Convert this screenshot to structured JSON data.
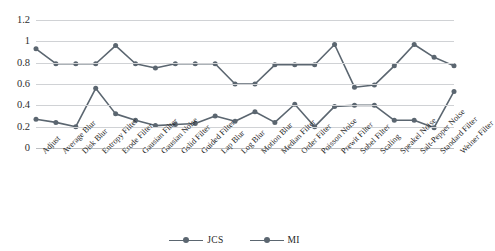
{
  "top_sliver_text": "",
  "chart_data": {
    "type": "line",
    "title": "",
    "subtitle": "",
    "xlabel": "",
    "ylabel": "",
    "ylim": [
      0,
      1.2
    ],
    "yticks": [
      "0",
      "0.2",
      "0.4",
      "0.6",
      "0.8",
      "1",
      "1.2"
    ],
    "ytick_values": [
      0,
      0.2,
      0.4,
      0.6,
      0.8,
      1,
      1.2
    ],
    "grid": "horizontal",
    "legend_position": "bottom",
    "categories": [
      "Adjust",
      "Average Blur",
      "Disk Blur",
      "Entropy Filter",
      "Erode Filter",
      "Gausian Filter",
      "Gausian Noise",
      "Gslid Filter",
      "Guided Filter",
      "Lap Blur",
      "Log Blur",
      "Motion Blur",
      "Median Filter",
      "Order Filter",
      "Poisson Noise",
      "Prewit Filter",
      "Sobel Filter",
      "Scaling",
      "Speakel Noise",
      "Salt-Pepper Noise",
      "Standard Filter",
      "Weiner Filter"
    ],
    "series": [
      {
        "name": "JCS",
        "color": "#5b6670",
        "values": [
          0.93,
          0.79,
          0.79,
          0.79,
          0.96,
          0.79,
          0.75,
          0.79,
          0.79,
          0.79,
          0.6,
          0.6,
          0.78,
          0.78,
          0.78,
          0.97,
          0.57,
          0.59,
          0.77,
          0.97,
          0.85,
          0.77
        ]
      },
      {
        "name": "MI",
        "color": "#5b6670",
        "values": [
          0.27,
          0.24,
          0.2,
          0.56,
          0.32,
          0.26,
          0.21,
          0.22,
          0.23,
          0.3,
          0.25,
          0.34,
          0.24,
          0.41,
          0.2,
          0.39,
          0.4,
          0.4,
          0.26,
          0.26,
          0.19,
          0.53
        ]
      }
    ],
    "series_tail": {
      "JCS_last": 0.77,
      "MI_last": 0.29
    }
  },
  "legend": {
    "items": [
      {
        "label": "JCS",
        "color": "#5b6670"
      },
      {
        "label": "MI",
        "color": "#5b6670"
      }
    ]
  }
}
